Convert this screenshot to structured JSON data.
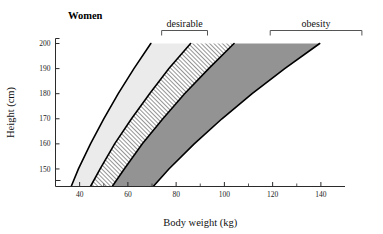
{
  "chart_data": {
    "type": "area",
    "title": "Women",
    "xlabel": "Body weight (kg)",
    "ylabel": "Height (cm)",
    "xlim": [
      30,
      150
    ],
    "ylim": [
      143,
      202
    ],
    "grid": false,
    "legend_position": "top",
    "x_ticks_major": [
      40,
      60,
      80,
      100,
      120,
      140
    ],
    "x_ticklabels": [
      "40",
      "60",
      "80",
      "100",
      "120",
      "140"
    ],
    "x_ticks_minor": [
      50,
      70,
      90,
      110,
      130
    ],
    "y_ticks_major": [
      150,
      160,
      170,
      180,
      190,
      200
    ],
    "y_ticklabels": [
      "150",
      "160",
      "170",
      "180",
      "190",
      "200"
    ],
    "annotations": [
      {
        "label": "desirable",
        "bracket_from_kg": 74,
        "bracket_to_kg": 93
      },
      {
        "label": "obesity",
        "bracket_from_kg": 119,
        "bracket_to_kg": 157
      }
    ],
    "bands": [
      {
        "name": "underweight",
        "fill": "#ebebeb",
        "pattern": "solid",
        "left_boundary": [
          {
            "height_cm": 143,
            "weight_kg": 36.5
          },
          {
            "height_cm": 150,
            "weight_kg": 39.5
          },
          {
            "height_cm": 160,
            "weight_kg": 44.5
          },
          {
            "height_cm": 170,
            "weight_kg": 50.0
          },
          {
            "height_cm": 180,
            "weight_kg": 56.0
          },
          {
            "height_cm": 190,
            "weight_kg": 62.5
          },
          {
            "height_cm": 200,
            "weight_kg": 69.5
          }
        ],
        "right_boundary": [
          {
            "height_cm": 143,
            "weight_kg": 44.5
          },
          {
            "height_cm": 150,
            "weight_kg": 48.5
          },
          {
            "height_cm": 160,
            "weight_kg": 54.5
          },
          {
            "height_cm": 170,
            "weight_kg": 61.5
          },
          {
            "height_cm": 180,
            "weight_kg": 69.0
          },
          {
            "height_cm": 190,
            "weight_kg": 77.0
          },
          {
            "height_cm": 200,
            "weight_kg": 86.0
          }
        ]
      },
      {
        "name": "desirable",
        "fill": "#ffffff",
        "pattern": "diagonal-hatch",
        "left_boundary": [
          {
            "height_cm": 143,
            "weight_kg": 44.5
          },
          {
            "height_cm": 150,
            "weight_kg": 48.5
          },
          {
            "height_cm": 160,
            "weight_kg": 54.5
          },
          {
            "height_cm": 170,
            "weight_kg": 61.5
          },
          {
            "height_cm": 180,
            "weight_kg": 69.0
          },
          {
            "height_cm": 190,
            "weight_kg": 77.0
          },
          {
            "height_cm": 200,
            "weight_kg": 86.0
          }
        ],
        "right_boundary": [
          {
            "height_cm": 143,
            "weight_kg": 53.5
          },
          {
            "height_cm": 150,
            "weight_kg": 58.5
          },
          {
            "height_cm": 160,
            "weight_kg": 66.0
          },
          {
            "height_cm": 170,
            "weight_kg": 74.5
          },
          {
            "height_cm": 180,
            "weight_kg": 83.5
          },
          {
            "height_cm": 190,
            "weight_kg": 93.5
          },
          {
            "height_cm": 200,
            "weight_kg": 104.0
          }
        ]
      },
      {
        "name": "obesity",
        "fill": "#939393",
        "pattern": "solid",
        "left_boundary": [
          {
            "height_cm": 143,
            "weight_kg": 53.5
          },
          {
            "height_cm": 150,
            "weight_kg": 58.5
          },
          {
            "height_cm": 160,
            "weight_kg": 66.0
          },
          {
            "height_cm": 170,
            "weight_kg": 74.5
          },
          {
            "height_cm": 180,
            "weight_kg": 83.5
          },
          {
            "height_cm": 190,
            "weight_kg": 93.5
          },
          {
            "height_cm": 200,
            "weight_kg": 104.0
          }
        ],
        "right_boundary": [
          {
            "height_cm": 143,
            "weight_kg": 70.5
          },
          {
            "height_cm": 150,
            "weight_kg": 77.0
          },
          {
            "height_cm": 160,
            "weight_kg": 87.5
          },
          {
            "height_cm": 170,
            "weight_kg": 99.0
          },
          {
            "height_cm": 180,
            "weight_kg": 111.5
          },
          {
            "height_cm": 190,
            "weight_kg": 125.0
          },
          {
            "height_cm": 200,
            "weight_kg": 139.5
          }
        ]
      }
    ]
  }
}
